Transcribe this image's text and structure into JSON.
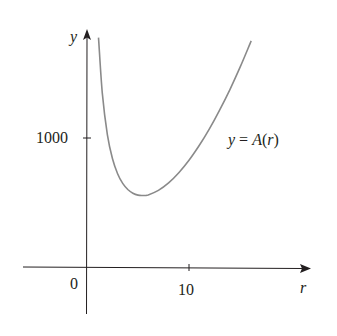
{
  "chart_data": {
    "type": "line",
    "title": "",
    "function_label": "y = A(r)",
    "function_label_parts": {
      "y": "y",
      "eq": " = ",
      "A": "A",
      "open": "(",
      "r": "r",
      "close": ")"
    },
    "xlabel": "r",
    "ylabel": "y",
    "origin_label": "0",
    "x_ticks": [
      {
        "value": 10,
        "label": "10"
      }
    ],
    "y_ticks": [
      {
        "value": 1000,
        "label": "1000"
      }
    ],
    "xlim": [
      -6.5,
      21.5
    ],
    "ylim": [
      -380,
      1780
    ],
    "grid": false,
    "legend": "none",
    "formula": "A(r) = 2*pi*r^2 + 2000/r",
    "series": [
      {
        "name": "A(r)",
        "x": [
          1.13,
          1.5,
          2,
          2.5,
          3,
          3.5,
          4,
          4.5,
          5,
          5.42,
          6,
          7,
          8,
          9,
          10,
          11,
          12,
          13,
          14,
          15,
          16.1
        ],
        "y": [
          1778,
          1348,
          1025,
          839,
          723,
          648,
          601,
          572,
          557,
          554,
          559,
          594,
          652,
          731,
          828,
          942,
          1071,
          1216,
          1374,
          1547,
          1753
        ]
      }
    ],
    "minimum": {
      "x": 5.42,
      "y": 554
    },
    "colors": {
      "curve": "#8a8a8a",
      "axes": "#231f20",
      "text": "#231f20"
    }
  }
}
